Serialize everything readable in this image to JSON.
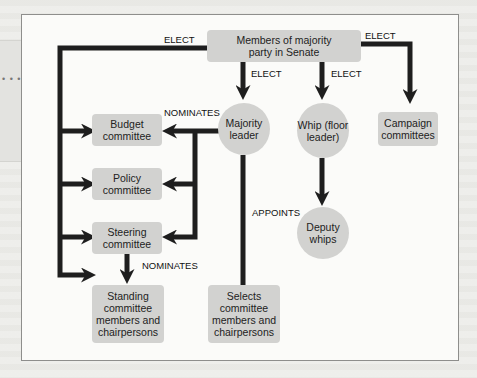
{
  "diagram": {
    "nodes": {
      "members": "Members of majority party in Senate",
      "majority_leader": "Majority leader",
      "whip": "Whip (floor leader)",
      "campaign": "Campaign committees",
      "budget": "Budget committee",
      "policy": "Policy committee",
      "steering": "Steering committee",
      "standing": "Standing committee members and chairpersons",
      "selects": "Selects committee members and chairpersons",
      "deputy": "Deputy whips"
    },
    "labels": {
      "elect_left": "ELECT",
      "elect_right": "ELECT",
      "elect_leader": "ELECT",
      "elect_whip": "ELECT",
      "nominates_leader": "NOMINATES",
      "appoints": "APPOINTS",
      "nominates_steering": "NOMINATES"
    },
    "sidebar": {
      "dots": "• • • •"
    },
    "colors": {
      "box": "#d2d2d0",
      "arrow": "#1e1e1e",
      "frame": "#8e8e8c"
    }
  }
}
